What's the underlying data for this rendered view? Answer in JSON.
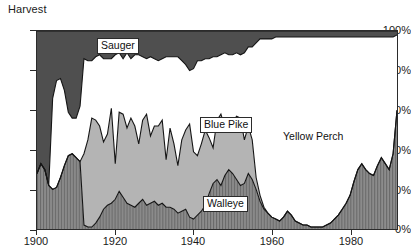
{
  "chart_data": {
    "type": "area",
    "stacked": "percent",
    "title": "Harvest",
    "xlabel": "",
    "ylabel": "",
    "grid": false,
    "legend_position": "inline-callouts",
    "xlim": [
      1900,
      1992
    ],
    "ylim": [
      0,
      100
    ],
    "xticks": [
      1900,
      1920,
      1940,
      1960,
      1980
    ],
    "xtick_labels": [
      "1900",
      "1920",
      "1940",
      "1960",
      "1980"
    ],
    "yticks": [
      0,
      20,
      40,
      60,
      80,
      100
    ],
    "ytick_labels": [
      "0%",
      "20%",
      "40%",
      "60%",
      "80%",
      "100%"
    ],
    "x": [
      1900,
      1901,
      1902,
      1903,
      1904,
      1905,
      1906,
      1907,
      1908,
      1909,
      1910,
      1911,
      1912,
      1913,
      1914,
      1915,
      1916,
      1917,
      1918,
      1919,
      1920,
      1921,
      1922,
      1923,
      1924,
      1925,
      1926,
      1927,
      1928,
      1929,
      1930,
      1931,
      1932,
      1933,
      1934,
      1935,
      1936,
      1937,
      1938,
      1939,
      1940,
      1941,
      1942,
      1943,
      1944,
      1945,
      1946,
      1947,
      1948,
      1949,
      1950,
      1951,
      1952,
      1953,
      1954,
      1955,
      1956,
      1957,
      1958,
      1959,
      1960,
      1961,
      1962,
      1963,
      1964,
      1965,
      1966,
      1967,
      1968,
      1969,
      1970,
      1971,
      1972,
      1973,
      1974,
      1975,
      1976,
      1977,
      1978,
      1979,
      1980,
      1981,
      1982,
      1983,
      1984,
      1985,
      1986,
      1987,
      1988,
      1989,
      1990,
      1991,
      1992
    ],
    "series": [
      {
        "name": "Walleye",
        "fill": "#7d7d7d",
        "pattern": "vertical-hatch",
        "values": [
          28,
          33,
          30,
          22,
          20,
          21,
          26,
          32,
          37,
          38,
          36,
          34,
          2,
          1,
          1,
          3,
          6,
          10,
          12,
          13,
          15,
          19,
          16,
          13,
          12,
          11,
          13,
          15,
          12,
          13,
          14,
          12,
          13,
          11,
          11,
          10,
          8,
          9,
          10,
          6,
          5,
          7,
          9,
          12,
          18,
          23,
          25,
          22,
          27,
          30,
          28,
          25,
          22,
          23,
          28,
          25,
          20,
          14,
          10,
          8,
          6,
          5,
          4,
          6,
          9,
          7,
          4,
          3,
          2,
          2,
          1,
          1,
          1,
          1,
          2,
          3,
          5,
          7,
          10,
          13,
          17,
          24,
          30,
          33,
          30,
          28,
          27,
          32,
          36,
          33,
          30,
          38,
          60
        ]
      },
      {
        "name": "Blue Pike",
        "fill": "#b4b4b4",
        "pattern": "solid",
        "values": [
          0,
          0,
          0,
          0,
          0,
          0,
          0,
          0,
          0,
          0,
          0,
          0,
          36,
          44,
          55,
          52,
          46,
          34,
          36,
          48,
          18,
          40,
          42,
          38,
          44,
          41,
          30,
          40,
          46,
          34,
          38,
          40,
          42,
          24,
          40,
          33,
          24,
          36,
          40,
          47,
          34,
          30,
          34,
          38,
          28,
          18,
          30,
          36,
          24,
          25,
          26,
          32,
          34,
          22,
          24,
          20,
          6,
          3,
          1,
          0,
          0,
          0,
          0,
          0,
          0,
          0,
          0,
          0,
          0,
          0,
          0,
          0,
          0,
          0,
          0,
          0,
          0,
          0,
          0,
          0,
          0,
          0,
          0,
          0,
          0,
          0,
          0,
          0,
          0,
          0,
          0,
          0,
          0
        ]
      },
      {
        "name": "Yellow Perch",
        "fill": "#ffffff",
        "pattern": "solid",
        "values": [
          0,
          0,
          0,
          0,
          46,
          54,
          50,
          38,
          22,
          18,
          20,
          28,
          48,
          40,
          29,
          32,
          36,
          42,
          38,
          25,
          55,
          30,
          28,
          38,
          30,
          36,
          45,
          32,
          28,
          40,
          34,
          33,
          31,
          52,
          36,
          44,
          55,
          40,
          33,
          27,
          42,
          48,
          42,
          36,
          40,
          46,
          32,
          30,
          38,
          33,
          34,
          32,
          32,
          44,
          40,
          47,
          68,
          79,
          85,
          88,
          90,
          92,
          93,
          91,
          88,
          90,
          93,
          94,
          95,
          95,
          96,
          96,
          96,
          96,
          95,
          94,
          92,
          90,
          87,
          84,
          80,
          73,
          67,
          64,
          67,
          69,
          70,
          65,
          61,
          64,
          67,
          59,
          38
        ]
      },
      {
        "name": "Sauger",
        "fill": "#4f4f4f",
        "pattern": "solid",
        "values": [
          72,
          67,
          70,
          78,
          34,
          25,
          24,
          30,
          41,
          44,
          44,
          38,
          14,
          15,
          15,
          13,
          12,
          14,
          14,
          14,
          12,
          11,
          14,
          11,
          14,
          12,
          12,
          13,
          14,
          13,
          14,
          15,
          14,
          13,
          13,
          13,
          13,
          15,
          17,
          20,
          19,
          15,
          15,
          14,
          14,
          13,
          13,
          12,
          11,
          12,
          12,
          11,
          12,
          11,
          8,
          8,
          6,
          4,
          4,
          4,
          4,
          3,
          3,
          3,
          3,
          3,
          3,
          3,
          3,
          3,
          3,
          3,
          3,
          3,
          3,
          3,
          3,
          3,
          3,
          3,
          3,
          3,
          3,
          3,
          3,
          3,
          3,
          3,
          3,
          3,
          3,
          3,
          2
        ]
      }
    ],
    "annotations": [
      {
        "text": "Sauger",
        "x": 1925,
        "y": 95
      },
      {
        "text": "Blue Pike",
        "x": 1948,
        "y": 54
      },
      {
        "text": "Walleye",
        "x": 1950,
        "y": 12
      },
      {
        "text": "Yellow Perch",
        "x": 1968,
        "y": 46
      }
    ]
  },
  "labels": {
    "title": "Harvest",
    "sauger": "Sauger",
    "blue_pike": "Blue Pike",
    "walleye": "Walleye",
    "yellow_perch": "Yellow Perch",
    "y0": "0%",
    "y20": "20%",
    "y40": "40%",
    "y60": "60%",
    "y80": "80%",
    "y100": "100%",
    "x1900": "1900",
    "x1920": "1920",
    "x1940": "1940",
    "x1960": "1960",
    "x1980": "1980"
  }
}
